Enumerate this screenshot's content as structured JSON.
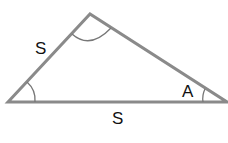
{
  "diagram": {
    "type": "triangle",
    "colors": {
      "stroke": "#8a8a8a",
      "arc": "#777777",
      "text": "#111111",
      "background": "#ffffff"
    },
    "vertices": {
      "left": {
        "x": 8,
        "y": 102
      },
      "top": {
        "x": 90,
        "y": 14
      },
      "right": {
        "x": 227,
        "y": 102
      }
    },
    "labels": {
      "left_side": "S",
      "bottom_side": "S",
      "right_angle": "A"
    },
    "angle_marks": [
      "top-vertex-arc",
      "left-vertex-arc",
      "right-vertex-arc"
    ]
  }
}
